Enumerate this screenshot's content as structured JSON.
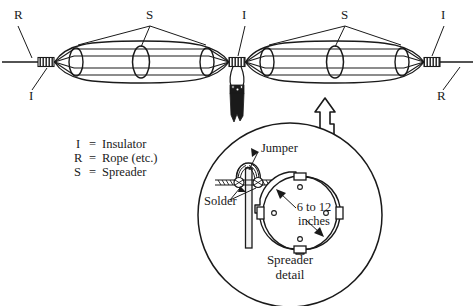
{
  "diagram": {
    "title": "Spreader detail",
    "top_labels": [
      {
        "name": "rope-left",
        "text": "R",
        "x": 14,
        "y": 19
      },
      {
        "name": "insulator-left",
        "text": "I",
        "x": 29,
        "y": 96
      },
      {
        "name": "spreader-left",
        "text": "S",
        "x": 146,
        "y": 18
      },
      {
        "name": "insulator-center",
        "text": "I",
        "x": 243,
        "y": 18
      },
      {
        "name": "spreader-right",
        "text": "S",
        "x": 341,
        "y": 18
      },
      {
        "name": "insulator-right",
        "text": "I",
        "x": 441,
        "y": 18
      },
      {
        "name": "rope-right",
        "text": "R",
        "x": 436,
        "y": 96
      }
    ],
    "legend": {
      "rows": [
        {
          "key": "I",
          "eq": "=",
          "value": "Insulator"
        },
        {
          "key": "R",
          "eq": "=",
          "value": "Rope (etc.)"
        },
        {
          "key": "S",
          "eq": "=",
          "value": "Spreader"
        }
      ]
    },
    "detail": {
      "jumper_label": "Jumper",
      "solder_label": "Solder",
      "dimension_line1": "6 to 12",
      "dimension_line2": "inches",
      "caption_line1": "Spreader",
      "caption_line2": "detail"
    },
    "colors": {
      "ink": "#1a1a1a",
      "background": "#ffffff",
      "fill_light": "#f2f2f2"
    }
  }
}
